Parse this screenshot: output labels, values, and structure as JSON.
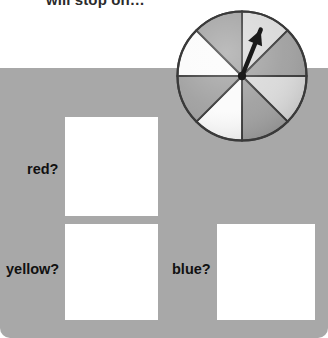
{
  "prompt": {
    "text": "will stop on…"
  },
  "panel": {
    "background_color": "#a8a8a8"
  },
  "questions": [
    {
      "label": "red?",
      "answer_value": ""
    },
    {
      "label": "yellow?",
      "answer_value": ""
    },
    {
      "label": "blue?",
      "answer_value": ""
    }
  ],
  "spinner": {
    "name": "spinner-wheel",
    "sector_count": 8,
    "outline_color": "#3a3a3a",
    "colors": {
      "dark_gray": "#a0a0a0",
      "light_gray": "#d9d9d9",
      "white": "#fbfbfb"
    },
    "sectors": [
      {
        "index": 1,
        "start_deg": 0,
        "end_deg": 45,
        "fill": "#d9d9d9"
      },
      {
        "index": 2,
        "start_deg": 45,
        "end_deg": 90,
        "fill": "#a0a0a0"
      },
      {
        "index": 3,
        "start_deg": 90,
        "end_deg": 135,
        "fill": "#d9d9d9"
      },
      {
        "index": 4,
        "start_deg": 135,
        "end_deg": 180,
        "fill": "#a0a0a0"
      },
      {
        "index": 5,
        "start_deg": 180,
        "end_deg": 225,
        "fill": "#fbfbfb"
      },
      {
        "index": 6,
        "start_deg": 225,
        "end_deg": 270,
        "fill": "#a0a0a0"
      },
      {
        "index": 7,
        "start_deg": 270,
        "end_deg": 315,
        "fill": "#fbfbfb"
      },
      {
        "index": 8,
        "start_deg": 315,
        "end_deg": 360,
        "fill": "#a0a0a0"
      }
    ],
    "pointer": {
      "angle_deg": 22,
      "points_to_sector": 1,
      "color": "#1a1a1a"
    }
  }
}
